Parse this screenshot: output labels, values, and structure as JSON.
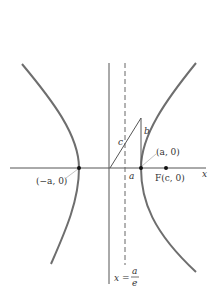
{
  "diagram": {
    "type": "hyperbola",
    "labels": {
      "x_axis": "x",
      "left_vertex": "(−a, 0)",
      "right_vertex": "(a, 0)",
      "focus": "F(c, 0)",
      "side_c": "c",
      "side_b": "b",
      "segment_a": "a",
      "directrix_lhs": "x =",
      "directrix_num": "a",
      "directrix_den": "e"
    },
    "colors": {
      "curve": "#6e6e6e",
      "axis": "#555555",
      "text": "#333333"
    }
  }
}
